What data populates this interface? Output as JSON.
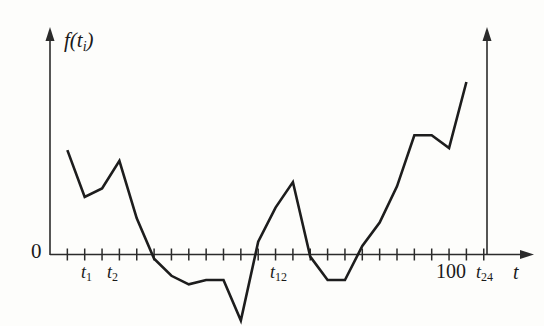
{
  "chart_data": {
    "type": "line",
    "title": "",
    "subtitle": "",
    "xlabel": "t",
    "ylabel": "f(t_i)",
    "legend": [],
    "grid": false,
    "axis_origin_label": "0",
    "xlim": [
      0,
      24.8
    ],
    "ylim": [
      -3.2,
      8.5
    ],
    "x_tick_labels": [
      {
        "index": 1,
        "text": "t1",
        "base": "t",
        "sub": "1"
      },
      {
        "index": 2,
        "text": "t2",
        "base": "t",
        "sub": "2"
      },
      {
        "index": 12,
        "text": "t12",
        "base": "t",
        "sub": "12"
      },
      {
        "index": 22,
        "text": "100",
        "base": "100",
        "sub": ""
      },
      {
        "index": 24,
        "text": "t24",
        "base": "t",
        "sub": "24"
      }
    ],
    "x_tick_count": 25,
    "series": [
      {
        "name": "f(t_i)",
        "x": [
          1,
          2,
          3,
          4,
          5,
          6,
          7,
          8,
          9,
          10,
          11,
          12,
          13,
          14,
          15,
          16,
          17,
          18,
          19,
          20,
          21,
          22,
          23,
          24
        ],
        "values": [
          4.9,
          2.7,
          3.1,
          4.4,
          1.7,
          -0.2,
          -1.0,
          -1.4,
          -1.2,
          -1.2,
          -3.1,
          0.6,
          2.2,
          3.4,
          -0.1,
          -1.2,
          -1.2,
          0.4,
          1.5,
          3.2,
          5.6,
          5.6,
          5.0,
          8.1
        ]
      }
    ],
    "annotations": {
      "terminal_vertical_marker": "t24",
      "y_axis_arrow": true,
      "x_axis_arrow": true
    },
    "colors": {
      "line": "#1d1d1d",
      "axis": "#2b2b2b",
      "background": "#fdfdfb"
    }
  },
  "labels": {
    "zero": "0",
    "y_axis": "f(t",
    "y_axis_sub": "i",
    "y_axis_close": ")",
    "t1_base": "t",
    "t1_sub": "1",
    "t2_base": "t",
    "t2_sub": "2",
    "t12_base": "t",
    "t12_sub": "12",
    "hundred": "100",
    "t24_base": "t",
    "t24_sub": "24",
    "t_axis": "t"
  }
}
